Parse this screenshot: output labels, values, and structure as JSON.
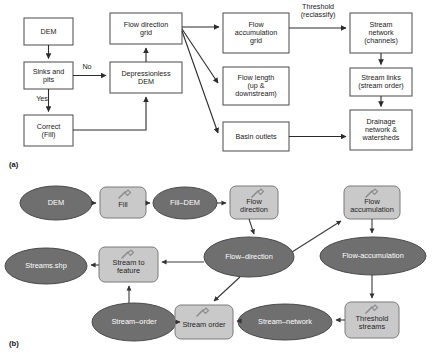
{
  "figure": {
    "panels": [
      {
        "id": "a",
        "caption": "(a)",
        "caption_x": 9,
        "caption_y": 160
      },
      {
        "id": "b",
        "caption": "(b)",
        "caption_x": 9,
        "caption_y": 339
      }
    ]
  },
  "colors": {
    "box_stroke": "#5a5a5a",
    "box_fill": "#ffffff",
    "ellipse_fill": "#6f6f6f",
    "ellipse_stroke": "#4a4a4a",
    "rounded_fill": "#c9c9c9",
    "rounded_stroke": "#7a7a7a",
    "arrow": "#2b2b2b",
    "text_dark": "#1a1a1a",
    "text_light": "#ffffff"
  },
  "panel_a": {
    "type": "flowchart",
    "nodes": [
      {
        "id": "dem",
        "label": "DEM",
        "x": 24,
        "y": 18,
        "w": 49,
        "h": 27
      },
      {
        "id": "sinks",
        "label": "Sinks and\npits",
        "x": 24,
        "y": 62,
        "w": 49,
        "h": 27
      },
      {
        "id": "correct",
        "label": "Correct\n(Fill)",
        "x": 24,
        "y": 115,
        "w": 49,
        "h": 31
      },
      {
        "id": "depressionless",
        "label": "Depressionless\nDEM",
        "x": 110,
        "y": 62,
        "w": 72,
        "h": 31
      },
      {
        "id": "flowdir",
        "label": "Flow direction\ngrid",
        "x": 110,
        "y": 13,
        "w": 72,
        "h": 31
      },
      {
        "id": "flowaccum",
        "label": "Flow\naccumulation\ngrid",
        "x": 223,
        "y": 13,
        "w": 66,
        "h": 40
      },
      {
        "id": "flowlength",
        "label": "Flow length\n(up &\ndownstream)",
        "x": 223,
        "y": 67,
        "w": 66,
        "h": 38
      },
      {
        "id": "basinoutlets",
        "label": "Basin outlets",
        "x": 223,
        "y": 122,
        "w": 66,
        "h": 29
      },
      {
        "id": "streamnet",
        "label": "Stream\nnetwork\n(channels)",
        "x": 350,
        "y": 13,
        "w": 62,
        "h": 40
      },
      {
        "id": "streamlinks",
        "label": "Stream links\n(stream order)",
        "x": 350,
        "y": 68,
        "w": 62,
        "h": 28
      },
      {
        "id": "drainage",
        "label": "Drainage\nnetwork &\nwatersheds",
        "x": 350,
        "y": 110,
        "w": 62,
        "h": 40
      }
    ],
    "edge_labels": [
      {
        "id": "no",
        "text": "No",
        "x": 79,
        "y": 65
      },
      {
        "id": "yes",
        "text": "Yes",
        "x": 33,
        "y": 96
      },
      {
        "id": "threshold",
        "text": "Threshold\n(reclassify)",
        "x": 293,
        "y": 5
      }
    ],
    "edges": [
      {
        "from": "dem",
        "to": "sinks"
      },
      {
        "from": "sinks",
        "to": "depressionless",
        "label": "No"
      },
      {
        "from": "sinks",
        "to": "correct",
        "label": "Yes"
      },
      {
        "from": "correct",
        "to": "depressionless"
      },
      {
        "from": "depressionless",
        "to": "flowdir"
      },
      {
        "from": "flowdir",
        "to": "flowaccum"
      },
      {
        "from": "flowdir",
        "to": "flowlength"
      },
      {
        "from": "flowdir",
        "to": "basinoutlets"
      },
      {
        "from": "flowaccum",
        "to": "streamnet",
        "label": "Threshold (reclassify)"
      },
      {
        "from": "streamnet",
        "to": "streamlinks"
      },
      {
        "from": "streamlinks",
        "to": "drainage"
      },
      {
        "from": "basinoutlets",
        "to": "drainage"
      }
    ]
  },
  "panel_b": {
    "type": "model-builder-diagram",
    "nodes": [
      {
        "id": "b_dem",
        "shape": "ellipse",
        "label": "DEM",
        "cx": 56,
        "cy": 203,
        "rx": 36,
        "ry": 17
      },
      {
        "id": "b_fill",
        "shape": "rect",
        "label": "Fill",
        "x": 100,
        "y": 187,
        "w": 46,
        "h": 31,
        "tool": true
      },
      {
        "id": "b_filldem",
        "shape": "ellipse",
        "label": "Fill–DEM",
        "cx": 185,
        "cy": 203,
        "rx": 32,
        "ry": 16
      },
      {
        "id": "b_flowdir",
        "shape": "rect",
        "label": "Flow\ndirection",
        "x": 230,
        "y": 186,
        "w": 48,
        "h": 33,
        "tool": true
      },
      {
        "id": "b_flowaccum",
        "shape": "rect",
        "label": "Flow\naccumulation",
        "x": 344,
        "y": 186,
        "w": 56,
        "h": 33,
        "tool": true
      },
      {
        "id": "b_flowdirdata",
        "shape": "ellipse",
        "label": "Flow–direction",
        "cx": 249,
        "cy": 257,
        "rx": 45,
        "ry": 20
      },
      {
        "id": "b_flowaccdata",
        "shape": "ellipse",
        "label": "Flow-accumulation",
        "cx": 373,
        "cy": 256,
        "rx": 53,
        "ry": 19
      },
      {
        "id": "b_stream2feat",
        "shape": "rect",
        "label": "Stream to\nfeature",
        "x": 99,
        "y": 247,
        "w": 59,
        "h": 35,
        "tool": true
      },
      {
        "id": "b_streamsshp",
        "shape": "ellipse",
        "label": "Streams.shp",
        "cx": 46,
        "cy": 266,
        "rx": 41,
        "ry": 18
      },
      {
        "id": "b_streamorder",
        "shape": "rect",
        "label": "Stream order",
        "x": 175,
        "y": 305,
        "w": 58,
        "h": 34,
        "tool": true
      },
      {
        "id": "b_streamorderdata",
        "shape": "ellipse",
        "label": "Stream–order",
        "cx": 134,
        "cy": 322,
        "rx": 42,
        "ry": 19
      },
      {
        "id": "b_streamnetdata",
        "shape": "ellipse",
        "label": "Stream–network",
        "cx": 285,
        "cy": 322,
        "rx": 47,
        "ry": 18
      },
      {
        "id": "b_threshold",
        "shape": "rect",
        "label": "Threshold\nstreams",
        "x": 345,
        "y": 302,
        "w": 54,
        "h": 36,
        "tool": true
      }
    ],
    "edges": [
      {
        "from": "b_dem",
        "to": "b_fill"
      },
      {
        "from": "b_fill",
        "to": "b_filldem"
      },
      {
        "from": "b_filldem",
        "to": "b_flowdir"
      },
      {
        "from": "b_flowdir",
        "to": "b_flowdirdata"
      },
      {
        "from": "b_flowdirdata",
        "to": "b_flowaccum"
      },
      {
        "from": "b_flowaccum",
        "to": "b_flowaccdata"
      },
      {
        "from": "b_flowaccdata",
        "to": "b_threshold"
      },
      {
        "from": "b_threshold",
        "to": "b_streamnetdata"
      },
      {
        "from": "b_streamnetdata",
        "to": "b_streamorder"
      },
      {
        "from": "b_streamorder",
        "to": "b_streamorderdata"
      },
      {
        "from": "b_streamorderdata",
        "to": "b_stream2feat"
      },
      {
        "from": "b_flowdirdata",
        "to": "b_stream2feat"
      },
      {
        "from": "b_flowdirdata",
        "to": "b_streamorder"
      },
      {
        "from": "b_stream2feat",
        "to": "b_streamsshp"
      }
    ]
  }
}
